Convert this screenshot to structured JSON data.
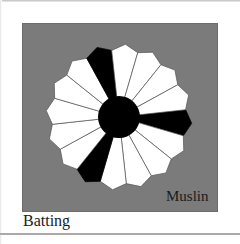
{
  "figure": {
    "labels": {
      "muslin": "Muslin",
      "batting": "Batting"
    },
    "colors": {
      "muslin_panel": "#7b7b7b",
      "batting": "#ffffff",
      "blade_light": "#ffffff",
      "blade_dark": "#000000",
      "center_circle": "#000000",
      "seam_line": "#555555"
    },
    "plate": {
      "center": [
        119,
        117
      ],
      "blade_count": 16,
      "start_angle_deg": 5,
      "inner_radius": 20,
      "tip_radius": 73,
      "corner_radius": 67,
      "center_circle_radius": 21,
      "dark_blade_indices": [
        0,
        5,
        11
      ]
    }
  }
}
